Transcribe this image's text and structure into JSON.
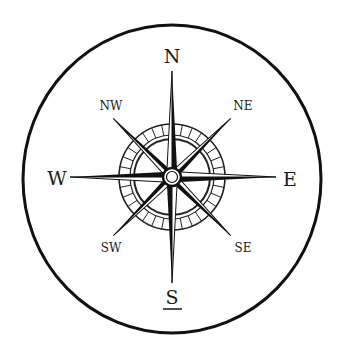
{
  "diagram": {
    "type": "compass-rose",
    "colors": {
      "ink": "#111111",
      "background": "#ffffff",
      "label": "#1a1a1a"
    },
    "cardinal_labels": [
      {
        "dir": "N",
        "label": "N",
        "x": 172,
        "y": 56
      },
      {
        "dir": "E",
        "label": "E",
        "x": 290,
        "y": 179
      },
      {
        "dir": "S",
        "label": "S",
        "x": 172,
        "y": 298,
        "underlined": true
      },
      {
        "dir": "W",
        "label": "W",
        "x": 57,
        "y": 178
      }
    ],
    "intercardinal_labels": [
      {
        "dir": "NE",
        "label": "NE",
        "x": 243,
        "y": 106
      },
      {
        "dir": "SE",
        "label": "SE",
        "x": 243,
        "y": 248
      },
      {
        "dir": "SW",
        "label": "SW",
        "x": 111,
        "y": 248
      },
      {
        "dir": "NW",
        "label": "NW",
        "x": 111,
        "y": 106
      }
    ]
  }
}
